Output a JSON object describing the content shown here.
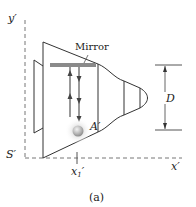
{
  "figure": {
    "caption": "(a)",
    "labels": {
      "y_axis": "y′",
      "origin": "S′",
      "x_axis": "x′",
      "x1_main": "x",
      "x1_sub": "1",
      "x1_prime": "′",
      "mirror": "Mirror",
      "point_a": "A′",
      "dimension": "D"
    },
    "colors": {
      "line": "#333333",
      "axis": "#666666",
      "mirror": "#8a8a8a",
      "ball": "#b5b5b5",
      "glow": "#e6e6e6"
    }
  }
}
